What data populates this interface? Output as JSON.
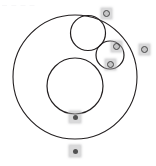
{
  "figure": {
    "background_color": "#ffffff",
    "stroke_color": "#231f20",
    "width": 156,
    "height": 166
  },
  "faint_header": {
    "visible": true,
    "fragments": [
      "—",
      "—",
      "—",
      "—"
    ]
  },
  "chart_data": {
    "type": "diagram",
    "shapes": [
      {
        "name": "outer-circle",
        "kind": "circle",
        "cx": 75,
        "cy": 77,
        "r": 62,
        "stroke": "#231f20",
        "stroke_width": 1.1,
        "fill": "none"
      },
      {
        "name": "large-inner-circle",
        "kind": "circle",
        "cx": 75,
        "cy": 86,
        "r": 28,
        "stroke": "#231f20",
        "stroke_width": 1.2,
        "fill": "none"
      },
      {
        "name": "top-inner-circle",
        "kind": "circle",
        "cx": 88,
        "cy": 33,
        "r": 17.5,
        "stroke": "#231f20",
        "stroke_width": 1.2,
        "fill": "none"
      },
      {
        "name": "small-right-circle",
        "kind": "circle",
        "cx": 110,
        "cy": 55,
        "r": 14,
        "stroke": "#231f20",
        "stroke_width": 1.2,
        "fill": "none"
      }
    ],
    "markers": [
      {
        "name": "marker-top",
        "x": 101,
        "y": 8,
        "w": 11,
        "h": 11,
        "style": "ring"
      },
      {
        "name": "marker-upper-right",
        "x": 111,
        "y": 41,
        "w": 11,
        "h": 11,
        "style": "ring"
      },
      {
        "name": "marker-right-edge",
        "x": 139,
        "y": 44,
        "w": 11,
        "h": 11,
        "style": "ring"
      },
      {
        "name": "marker-inner-right",
        "x": 105,
        "y": 59,
        "w": 11,
        "h": 11,
        "style": "ring"
      },
      {
        "name": "marker-bottom-center",
        "x": 69,
        "y": 111,
        "w": 12,
        "h": 12,
        "style": "solid"
      },
      {
        "name": "marker-bottom-outside",
        "x": 69,
        "y": 145,
        "w": 12,
        "h": 12,
        "style": "solid"
      }
    ]
  }
}
